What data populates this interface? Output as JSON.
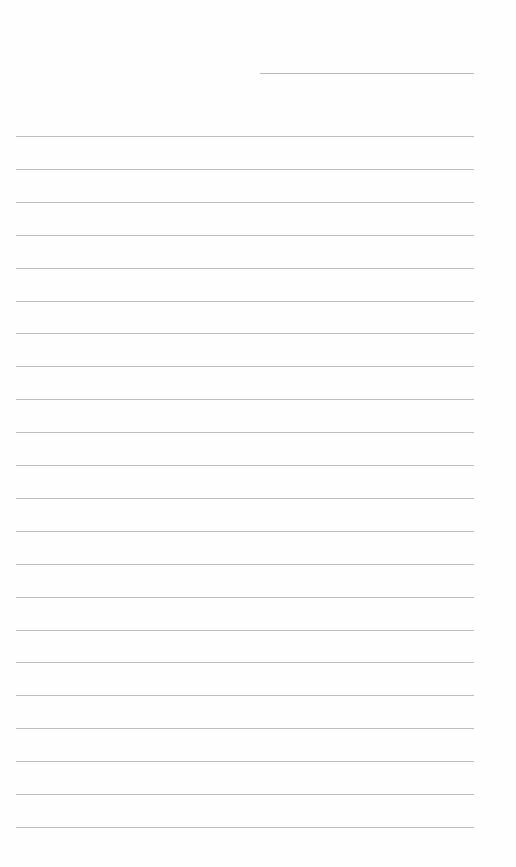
{
  "document": {
    "type": "lined-paper",
    "header_line": {
      "x": 260,
      "y": 73,
      "width": 214
    },
    "rules": {
      "count": 22,
      "x": 16,
      "width": 458,
      "first_y": 136,
      "spacing": 32.9
    },
    "colors": {
      "paper": "#fefefe",
      "rule": "#bcbcbc"
    }
  }
}
